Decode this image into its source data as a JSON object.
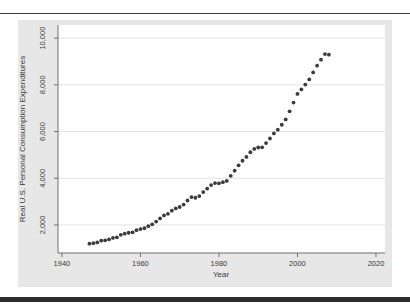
{
  "figure": {
    "background": "#e7e7e7",
    "plot_background": "#ffffff",
    "gridline_color": "#e2e2e2",
    "axis_color": "#6f6f6f",
    "text_color": "#3a3a3a",
    "rule_color": "#2d2d2d"
  },
  "chart_data": {
    "type": "scatter",
    "title": "",
    "xlabel": "Year",
    "ylabel": "Real U.S. Personal Consumption Expenditures",
    "marker_color": "#3b3b3b",
    "marker_radius": 1.9,
    "grid": "horizontal",
    "legend": "none",
    "xlim": [
      1939.0,
      2022.3
    ],
    "ylim": [
      800,
      10560
    ],
    "xticks": [
      1940,
      1960,
      1980,
      2000,
      2020
    ],
    "xtick_labels": [
      "1940",
      "1960",
      "1980",
      "2000",
      "2020"
    ],
    "yticks": [
      2000,
      4000,
      6000,
      8000,
      10000
    ],
    "ytick_labels": [
      "2,000",
      "4,000",
      "6,000",
      "8,000",
      "10,000"
    ],
    "x": [
      1947,
      1948,
      1949,
      1950,
      1951,
      1952,
      1953,
      1954,
      1955,
      1956,
      1957,
      1958,
      1959,
      1960,
      1961,
      1962,
      1963,
      1964,
      1965,
      1966,
      1967,
      1968,
      1969,
      1970,
      1971,
      1972,
      1973,
      1974,
      1975,
      1976,
      1977,
      1978,
      1979,
      1980,
      1981,
      1982,
      1983,
      1984,
      1985,
      1986,
      1987,
      1988,
      1989,
      1990,
      1991,
      1992,
      1993,
      1994,
      1995,
      1996,
      1997,
      1998,
      1999,
      2000,
      2001,
      2002,
      2003,
      2004,
      2005,
      2006,
      2007,
      2008
    ],
    "y": [
      1199,
      1220,
      1252,
      1328,
      1341,
      1381,
      1444,
      1472,
      1577,
      1627,
      1667,
      1683,
      1775,
      1823,
      1860,
      1948,
      2026,
      2144,
      2278,
      2408,
      2477,
      2610,
      2708,
      2770,
      2874,
      3048,
      3192,
      3166,
      3235,
      3408,
      3554,
      3706,
      3793,
      3783,
      3831,
      3884,
      4105,
      4323,
      4551,
      4750,
      4912,
      5113,
      5254,
      5316,
      5324,
      5505,
      5701,
      5918,
      6079,
      6291,
      6520,
      6865,
      7240,
      7608,
      7802,
      8010,
      8232,
      8532,
      8819,
      9074,
      9314,
      9291
    ]
  }
}
